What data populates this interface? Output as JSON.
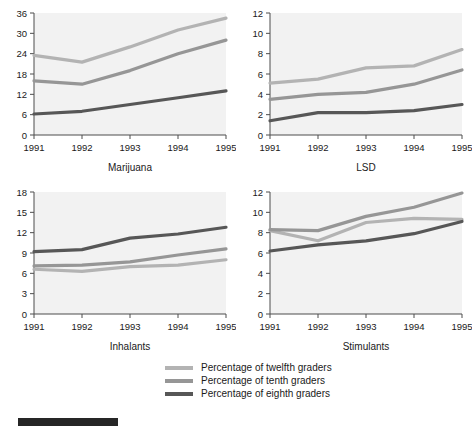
{
  "legend": {
    "items": [
      {
        "label": "Percentage of twelfth graders",
        "color": "#b3b3b3"
      },
      {
        "label": "Percentage of tenth graders",
        "color": "#969696"
      },
      {
        "label": "Percentage of eighth graders",
        "color": "#575757"
      }
    ]
  },
  "bottom_bar": {
    "color": "#262626"
  },
  "chart_data": [
    {
      "type": "line",
      "title": "Marijuana",
      "xlabel": "Marijuana",
      "ylabel": "",
      "categories": [
        "1991",
        "1992",
        "1993",
        "1994",
        "1995"
      ],
      "x": [
        1991,
        1992,
        1993,
        1994,
        1995
      ],
      "ylim": [
        0,
        36
      ],
      "yticks": [
        0,
        6,
        12,
        18,
        24,
        30,
        36
      ],
      "grid": false,
      "legend_position": "bottom",
      "series": [
        {
          "name": "Percentage of twelfth graders",
          "color": "#b3b3b3",
          "values": [
            23.5,
            21.5,
            26.0,
            31.0,
            34.5
          ]
        },
        {
          "name": "Percentage of tenth graders",
          "color": "#969696",
          "values": [
            16.0,
            15.0,
            19.0,
            24.0,
            28.0
          ]
        },
        {
          "name": "Percentage of eighth graders",
          "color": "#575757",
          "values": [
            6.2,
            7.0,
            9.0,
            11.0,
            13.0
          ]
        }
      ]
    },
    {
      "type": "line",
      "title": "LSD",
      "xlabel": "LSD",
      "ylabel": "",
      "categories": [
        "1991",
        "1992",
        "1993",
        "1994",
        "1995"
      ],
      "x": [
        1991,
        1992,
        1993,
        1994,
        1995
      ],
      "ylim": [
        0,
        12
      ],
      "yticks": [
        0,
        2,
        4,
        6,
        8,
        10,
        12
      ],
      "grid": false,
      "legend_position": "bottom",
      "series": [
        {
          "name": "Percentage of twelfth graders",
          "color": "#b3b3b3",
          "values": [
            5.1,
            5.5,
            6.6,
            6.8,
            8.4
          ]
        },
        {
          "name": "Percentage of tenth graders",
          "color": "#969696",
          "values": [
            3.5,
            4.0,
            4.2,
            5.0,
            6.4
          ]
        },
        {
          "name": "Percentage of eighth graders",
          "color": "#575757",
          "values": [
            1.4,
            2.2,
            2.2,
            2.4,
            3.0
          ]
        }
      ]
    },
    {
      "type": "line",
      "title": "Inhalants",
      "xlabel": "Inhalants",
      "ylabel": "",
      "categories": [
        "1991",
        "1992",
        "1993",
        "1994",
        "1995"
      ],
      "x": [
        1991,
        1992,
        1993,
        1994,
        1995
      ],
      "ylim": [
        0,
        18
      ],
      "yticks": [
        0,
        3,
        6,
        9,
        12,
        15,
        18
      ],
      "grid": false,
      "legend_position": "bottom",
      "series": [
        {
          "name": "Percentage of twelfth graders",
          "color": "#b3b3b3",
          "values": [
            6.6,
            6.3,
            7.0,
            7.2,
            8.0
          ]
        },
        {
          "name": "Percentage of tenth graders",
          "color": "#969696",
          "values": [
            7.1,
            7.2,
            7.7,
            8.7,
            9.6
          ]
        },
        {
          "name": "Percentage of eighth graders",
          "color": "#575757",
          "values": [
            9.2,
            9.5,
            11.2,
            11.8,
            12.8
          ]
        }
      ]
    },
    {
      "type": "line",
      "title": "Stimulants",
      "xlabel": "Stimulants",
      "ylabel": "",
      "categories": [
        "1991",
        "1992",
        "1993",
        "1994",
        "1995"
      ],
      "x": [
        1991,
        1992,
        1993,
        1994,
        1995
      ],
      "ylim": [
        0,
        12
      ],
      "yticks": [
        0,
        2,
        4,
        6,
        8,
        10,
        12
      ],
      "grid": false,
      "legend_position": "bottom",
      "series": [
        {
          "name": "Percentage of twelfth graders",
          "color": "#b3b3b3",
          "values": [
            8.2,
            7.2,
            9.0,
            9.4,
            9.3
          ]
        },
        {
          "name": "Percentage of tenth graders",
          "color": "#969696",
          "values": [
            8.3,
            8.2,
            9.6,
            10.5,
            11.9
          ]
        },
        {
          "name": "Percentage of eighth graders",
          "color": "#575757",
          "values": [
            6.2,
            6.8,
            7.2,
            7.9,
            9.1
          ]
        }
      ]
    }
  ]
}
